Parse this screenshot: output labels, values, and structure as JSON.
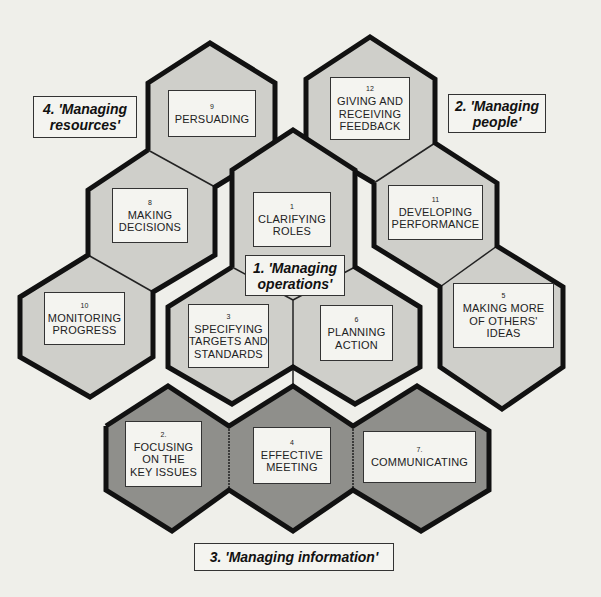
{
  "colors": {
    "background": "#efefea",
    "light_hex": "#cfcfca",
    "dark_hex": "#8f8f8b",
    "outline": "#111111",
    "box_fill": "#f4f4f0"
  },
  "groups": [
    {
      "id": "g1",
      "label": "1. 'Managing\noperations'"
    },
    {
      "id": "g2",
      "label": "2. 'Managing\npeople'"
    },
    {
      "id": "g3",
      "label": "3. 'Managing information'"
    },
    {
      "id": "g4",
      "label": "4. 'Managing\nresources'"
    }
  ],
  "skills": [
    {
      "num": "1",
      "label": "CLARIFYING\nROLES",
      "group": "1. 'Managing operations'"
    },
    {
      "num": "2.",
      "label": "FOCUSING\nON THE\nKEY ISSUES",
      "group": "3. 'Managing information'"
    },
    {
      "num": "3",
      "label": "SPECIFYING\nTARGETS AND\nSTANDARDS",
      "group": "1. 'Managing operations'"
    },
    {
      "num": "4",
      "label": "EFFECTIVE\nMEETING",
      "group": "3. 'Managing information'"
    },
    {
      "num": "5",
      "label": "MAKING MORE\nOF OTHERS'\nIDEAS",
      "group": "2. 'Managing people'"
    },
    {
      "num": "6",
      "label": "PLANNING\nACTION",
      "group": "1. 'Managing operations'"
    },
    {
      "num": "7.",
      "label": "COMMUNICATING",
      "group": "3. 'Managing information'"
    },
    {
      "num": "8",
      "label": "MAKING\nDECISIONS",
      "group": "4. 'Managing resources'"
    },
    {
      "num": "9",
      "label": "PERSUADING",
      "group": "4. 'Managing resources'"
    },
    {
      "num": "10",
      "label": "MONITORING\nPROGRESS",
      "group": "4. 'Managing resources'"
    },
    {
      "num": "11",
      "label": "DEVELOPING\nPERFORMANCE",
      "group": "2. 'Managing people'"
    },
    {
      "num": "12",
      "label": "GIVING AND\nRECEIVING\nFEEDBACK",
      "group": "2. 'Managing people'"
    }
  ]
}
